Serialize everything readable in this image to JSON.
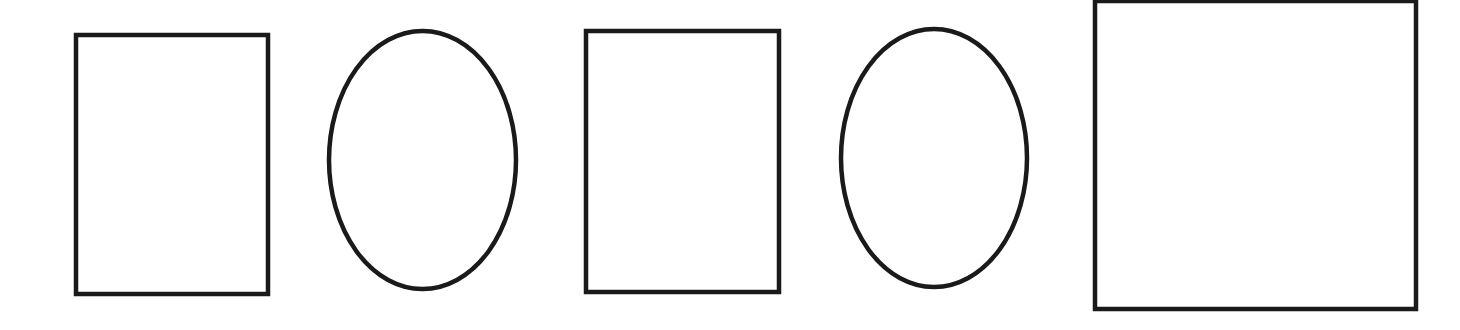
{
  "canvas": {
    "width": 1460,
    "height": 330,
    "background": "#ffffff"
  },
  "stroke": {
    "color": "#1a1a1a",
    "width": 4.5
  },
  "shapes": [
    {
      "id": "rect-1",
      "type": "rect",
      "x": 76,
      "y": 35,
      "width": 192,
      "height": 259
    },
    {
      "id": "ellipse-1",
      "type": "ellipse",
      "cx": 422.5,
      "cy": 160,
      "rx": 93.5,
      "ry": 129
    },
    {
      "id": "rect-2",
      "type": "rect",
      "x": 586,
      "y": 31,
      "width": 193,
      "height": 261
    },
    {
      "id": "ellipse-2",
      "type": "ellipse",
      "cx": 934,
      "cy": 158,
      "rx": 93,
      "ry": 129
    },
    {
      "id": "square-1",
      "type": "rect",
      "x": 1095,
      "y": 1,
      "width": 321,
      "height": 308
    }
  ]
}
